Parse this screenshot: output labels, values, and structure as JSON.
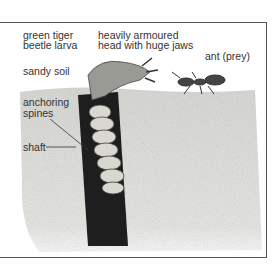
{
  "labels": {
    "larva_line1": "green tiger",
    "larva_line2": "beetle larva",
    "head_line1": "heavily armoured",
    "head_line2": "head with huge jaws",
    "ant": "ant (prey)",
    "soil": "sandy soil",
    "spines_line1": "anchoring",
    "spines_line2": "spines",
    "shaft": "shaft"
  },
  "colors": {
    "soil": "#e2e2de",
    "shaft": "#1e1e1e",
    "larva": "#d8d8d0",
    "frame": "#555555"
  }
}
